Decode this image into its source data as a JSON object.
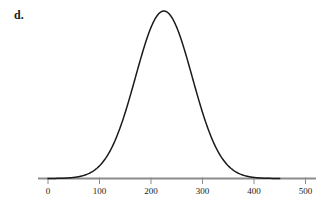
{
  "figure": {
    "part_label": "d.",
    "background_color": "#ffffff",
    "curve_color": "#1a1a1a",
    "axis_color": "#8c8c8c",
    "tick_color": "#8c8c8c",
    "label_color": "#1a1a1a"
  },
  "chart_data": {
    "type": "line",
    "title": "",
    "subtitle": "",
    "xlabel": "",
    "ylabel": "",
    "curve": "normal-distribution",
    "mean": 225,
    "std_dev": 55,
    "grid": false,
    "legend": null,
    "xlim": [
      -15,
      520
    ],
    "ylim": [
      0,
      1.08
    ],
    "x_ticks": [
      0,
      100,
      200,
      300,
      400,
      500
    ],
    "x_tick_labels": [
      "0",
      "100",
      "200",
      "300",
      "400",
      "500"
    ],
    "y_ticks": [],
    "y_tick_labels": [],
    "curve_domain": [
      0,
      450
    ],
    "peak_x": 225,
    "peak_y": 1.0,
    "x": [
      0,
      25,
      50,
      75,
      100,
      125,
      150,
      175,
      200,
      225,
      250,
      275,
      300,
      325,
      350,
      375,
      400,
      425,
      450
    ],
    "y": [
      0.0001,
      0.0013,
      0.0094,
      0.0442,
      0.1422,
      0.3247,
      0.5333,
      0.7849,
      0.9598,
      1.0,
      0.9598,
      0.7849,
      0.5333,
      0.3247,
      0.1422,
      0.0442,
      0.0094,
      0.0013,
      0.0001
    ],
    "annotations": [
      {
        "text": "d.",
        "role": "part-label",
        "x": 14,
        "y": 8
      }
    ]
  }
}
